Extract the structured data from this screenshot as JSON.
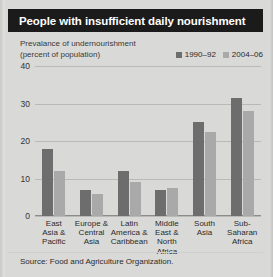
{
  "title": "People with insufficient daily nourishment",
  "axis_note": {
    "line1": "Prevalance of undernourishment",
    "line2": "(percent of population)"
  },
  "legend": [
    {
      "label": "1990–92",
      "color": "#6d6d6d"
    },
    {
      "label": "2004–06",
      "color": "#a9a9a9"
    }
  ],
  "source": "Source: Food and Agriculture Organization.",
  "colors": {
    "title_bar": "#1b1b1b",
    "title_text": "#ffffff",
    "background": "#d9d9d7",
    "series_1": "#6d6d6d",
    "series_2": "#a9a9a9",
    "gridline": "#b9b9b7"
  },
  "chart_data": {
    "type": "bar",
    "title": "People with insufficient daily nourishment",
    "xlabel": "",
    "ylabel": "Prevalance of undernourishment (percent of population)",
    "ylim": [
      0,
      40
    ],
    "yticks": [
      0,
      10,
      20,
      30,
      40
    ],
    "grid": true,
    "legend_position": "top-right",
    "categories": [
      "East Asia & Pacific",
      "Europe & Central Asia",
      "Latin America & Caribbean",
      "Middle East & North Africa",
      "South Asia",
      "Sub-Saharan Africa"
    ],
    "category_lines": [
      [
        "East",
        "Asia &",
        "Pacific"
      ],
      [
        "Europe &",
        "Central",
        "Asia"
      ],
      [
        "Latin",
        "America &",
        "Caribbean"
      ],
      [
        "Middle",
        "East &",
        "North",
        "Africa"
      ],
      [
        "South",
        "Asia"
      ],
      [
        "Sub-",
        "Saharan",
        "Africa"
      ]
    ],
    "series": [
      {
        "name": "1990–92",
        "values": [
          18,
          7,
          12,
          7,
          25,
          31.5
        ]
      },
      {
        "name": "2004–06",
        "values": [
          12,
          6,
          9,
          7.5,
          22.5,
          28
        ]
      }
    ],
    "source": "Source: Food and Agriculture Organization."
  }
}
